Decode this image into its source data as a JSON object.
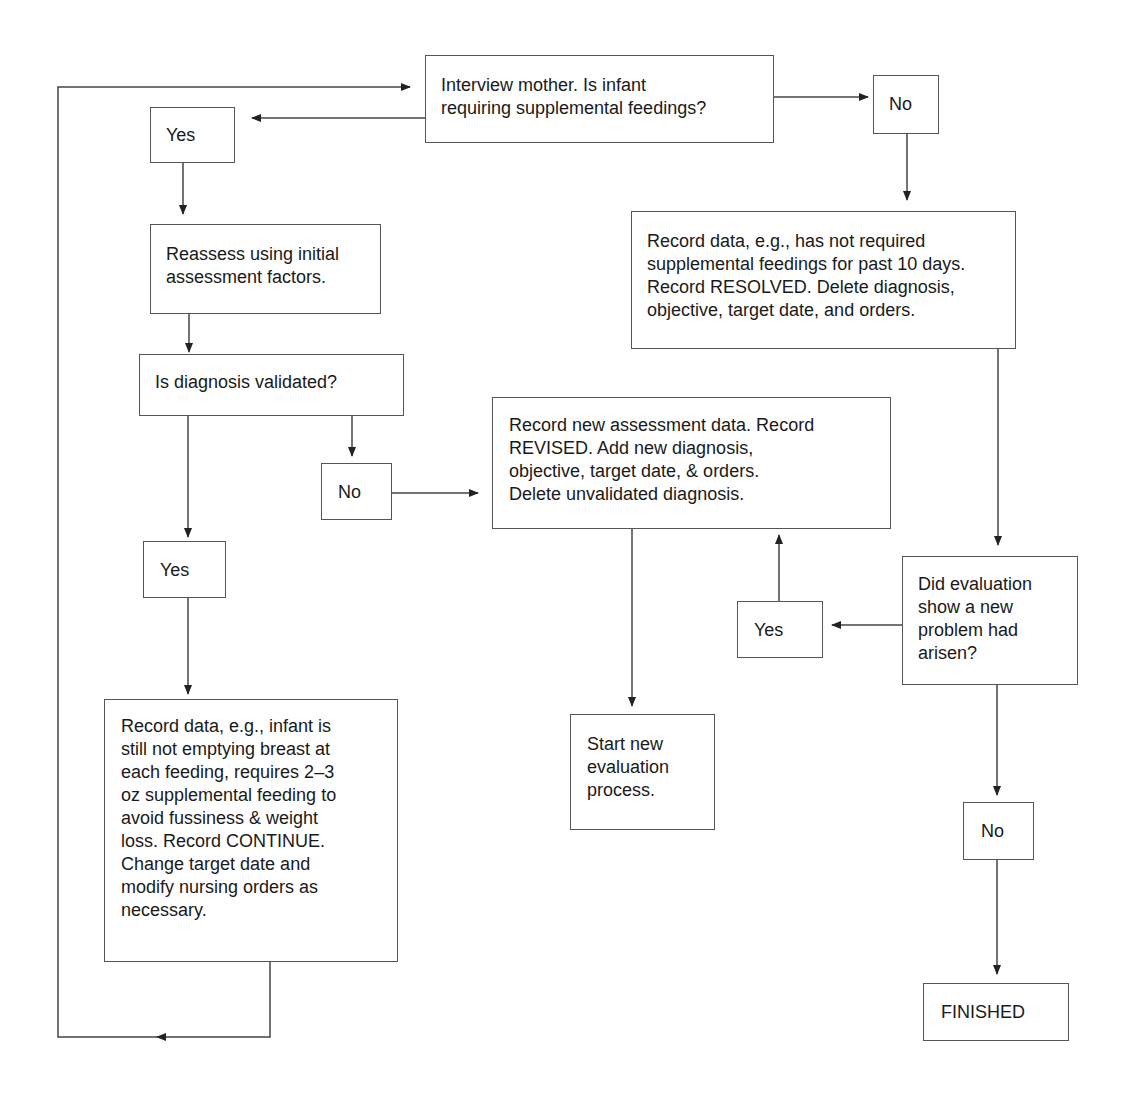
{
  "diagram": {
    "type": "flowchart",
    "nodes": {
      "interview": "Interview mother. Is infant\nrequiring supplemental feedings?",
      "yes_top": "Yes",
      "no_top": "No",
      "reassess": "Reassess using initial\nassessment factors.",
      "resolved": "Record data, e.g., has not required\nsupplemental feedings for past 10 days.\nRecord RESOLVED. Delete diagnosis,\nobjective, target date, and orders.",
      "validated": "Is diagnosis validated?",
      "no_validated": "No",
      "revised": "Record new assessment data. Record\nREVISED. Add new diagnosis,\nobjective, target date, & orders.\nDelete unvalidated diagnosis.",
      "yes_validated": "Yes",
      "new_problem": "Did evaluation\nshow a new\nproblem had\narisen?",
      "yes_new_problem": "Yes",
      "continue": "Record data, e.g., infant is\nstill not emptying breast at\neach feeding, requires 2–3\noz supplemental feeding to\navoid fussiness & weight\nloss. Record CONTINUE.\nChange target date and\nmodify nursing orders as\nnecessary.",
      "start_new": "Start new\nevaluation\nprocess.",
      "no_new_problem": "No",
      "finished": "FINISHED"
    },
    "edges": [
      {
        "from": "interview",
        "to": "yes_top"
      },
      {
        "from": "interview",
        "to": "no_top"
      },
      {
        "from": "yes_top",
        "to": "reassess"
      },
      {
        "from": "no_top",
        "to": "resolved"
      },
      {
        "from": "reassess",
        "to": "validated"
      },
      {
        "from": "validated",
        "to": "no_validated"
      },
      {
        "from": "validated",
        "to": "yes_validated"
      },
      {
        "from": "no_validated",
        "to": "revised"
      },
      {
        "from": "resolved",
        "to": "new_problem"
      },
      {
        "from": "new_problem",
        "to": "yes_new_problem"
      },
      {
        "from": "yes_new_problem",
        "to": "revised"
      },
      {
        "from": "new_problem",
        "to": "no_new_problem"
      },
      {
        "from": "yes_validated",
        "to": "continue"
      },
      {
        "from": "revised",
        "to": "start_new"
      },
      {
        "from": "no_new_problem",
        "to": "finished"
      },
      {
        "from": "continue",
        "to": "interview"
      }
    ]
  }
}
